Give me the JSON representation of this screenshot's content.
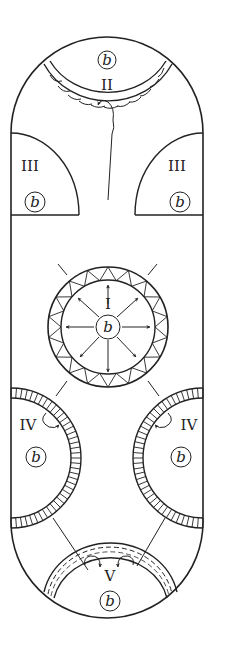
{
  "diagram": {
    "type": "schematic cross-section of capsule-shaped compartment with regions",
    "stroke_color": "#222222",
    "background": "#ffffff",
    "regions": [
      {
        "id": "I",
        "label": "I",
        "inner_label": "b",
        "description": "central circle with outward radiating arrows and triangle-patterned ring"
      },
      {
        "id": "II",
        "label": "II",
        "inner_label": "b",
        "description": "top cap region bordered by scalloped double band with looping arrow"
      },
      {
        "id": "III_left",
        "label": "III",
        "inner_label": "b",
        "description": "left quarter-circle region"
      },
      {
        "id": "III_right",
        "label": "III",
        "inner_label": "b",
        "description": "right quarter-circle region"
      },
      {
        "id": "IV_left",
        "label": "IV",
        "inner_label": "b",
        "description": "left half-circle region with hatched ring and curved arrow"
      },
      {
        "id": "IV_right",
        "label": "IV",
        "inner_label": "b",
        "description": "right half-circle region with hatched ring and curved arrow"
      },
      {
        "id": "V",
        "label": "V",
        "inner_label": "b",
        "description": "bottom cap region bordered by dashed double band with two inward arrows"
      }
    ]
  },
  "labels": {
    "I": "I",
    "II": "II",
    "III": "III",
    "IV": "IV",
    "V": "V",
    "b": "b"
  }
}
